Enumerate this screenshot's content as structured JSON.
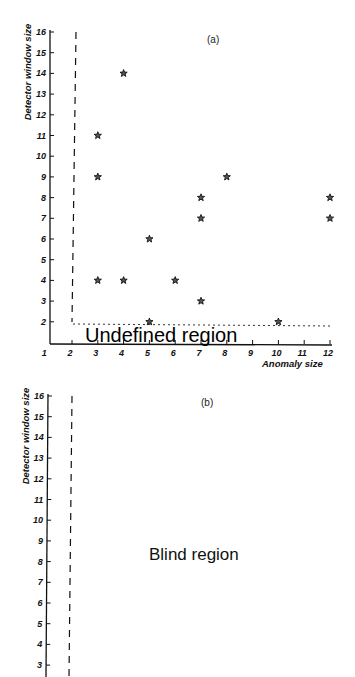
{
  "figure": {
    "panel_a": {
      "label": "(a)",
      "ylabel": "Detector window size",
      "xlabel": "Anomaly size",
      "region_text": "Undefined region"
    },
    "panel_b": {
      "label": "(b)",
      "ylabel": "Detector window size",
      "region_text": "Blind region"
    }
  },
  "chart_data": [
    {
      "panel": "a",
      "type": "scatter",
      "title": "(a)",
      "xlabel": "Anomaly size",
      "ylabel": "Detector window size",
      "xlim": [
        1,
        12
      ],
      "ylim": [
        1,
        16
      ],
      "x_ticks": [
        1,
        2,
        3,
        4,
        5,
        6,
        7,
        8,
        9,
        10,
        11,
        12
      ],
      "y_ticks": [
        2,
        3,
        4,
        5,
        6,
        7,
        8,
        9,
        10,
        11,
        12,
        13,
        14,
        15,
        16
      ],
      "grid": false,
      "marker": "star",
      "points": [
        {
          "x": 3,
          "y": 11
        },
        {
          "x": 4,
          "y": 14
        },
        {
          "x": 3,
          "y": 9
        },
        {
          "x": 3,
          "y": 4
        },
        {
          "x": 4,
          "y": 4
        },
        {
          "x": 5,
          "y": 6
        },
        {
          "x": 6,
          "y": 4
        },
        {
          "x": 5,
          "y": 2
        },
        {
          "x": 7,
          "y": 8
        },
        {
          "x": 7,
          "y": 7
        },
        {
          "x": 8,
          "y": 9
        },
        {
          "x": 7,
          "y": 3
        },
        {
          "x": 10,
          "y": 2
        },
        {
          "x": 12,
          "y": 8
        },
        {
          "x": 12,
          "y": 7
        }
      ],
      "boundaries": [
        {
          "style": "dashed",
          "orientation": "vertical",
          "x": 2,
          "from_y": 2,
          "to_y": 16
        },
        {
          "style": "dotted",
          "orientation": "horizontal",
          "y": 2,
          "from_x": 2,
          "to_x": 12
        }
      ],
      "annotations": [
        {
          "text": "Undefined region",
          "position": "below y=2 boundary"
        }
      ]
    },
    {
      "panel": "b",
      "type": "scatter",
      "title": "(b)",
      "xlabel": "",
      "ylabel": "Detector window size",
      "ylim": [
        3,
        16
      ],
      "y_ticks": [
        3,
        4,
        5,
        6,
        7,
        8,
        9,
        10,
        11,
        12,
        13,
        14,
        15,
        16
      ],
      "grid": false,
      "points": [],
      "boundaries": [
        {
          "style": "dashed",
          "orientation": "vertical",
          "x": 2,
          "from_y": 3,
          "to_y": 16
        }
      ],
      "annotations": [
        {
          "text": "Blind region",
          "position": "center"
        }
      ]
    }
  ]
}
